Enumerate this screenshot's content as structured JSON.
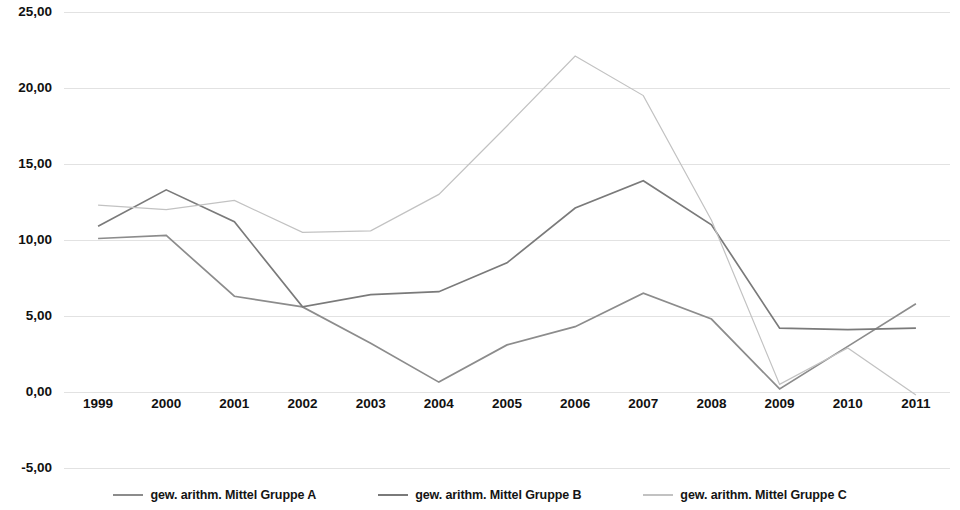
{
  "chart_data": {
    "type": "line",
    "title": "",
    "xlabel": "",
    "ylabel": "",
    "categories": [
      "1999",
      "2000",
      "2001",
      "2002",
      "2003",
      "2004",
      "2005",
      "2006",
      "2007",
      "2008",
      "2009",
      "2010",
      "2011"
    ],
    "ylim": [
      -5.0,
      25.0
    ],
    "yticks": [
      25.0,
      20.0,
      15.0,
      10.0,
      5.0,
      0.0,
      -5.0
    ],
    "ytick_labels": [
      "25,00",
      "20,00",
      "15,00",
      "10,00",
      "5,00",
      "0,00",
      "-5,00"
    ],
    "grid": true,
    "grid_axis": "y",
    "legend_position": "bottom",
    "decimal_separator": ",",
    "series": [
      {
        "name": "gew. arithm. Mittel Gruppe A",
        "color": "#8c8c8c",
        "values": [
          10.1,
          10.3,
          6.3,
          5.6,
          3.2,
          0.65,
          3.1,
          4.3,
          6.5,
          4.8,
          0.2,
          3.0,
          5.8
        ]
      },
      {
        "name": "gew. arithm. Mittel Gruppe B",
        "color": "#7a7a7a",
        "values": [
          10.9,
          13.3,
          11.2,
          5.6,
          6.4,
          6.6,
          8.5,
          12.1,
          13.9,
          11.0,
          4.2,
          4.1,
          4.2
        ]
      },
      {
        "name": "gew. arithm. Mittel Gruppe C",
        "color": "#c2c2c2",
        "values": [
          12.3,
          12.0,
          12.6,
          10.5,
          10.6,
          13.0,
          17.5,
          22.1,
          19.5,
          11.3,
          0.5,
          2.9,
          -0.2
        ]
      }
    ]
  },
  "legend": {
    "items": [
      {
        "label": "gew. arithm. Mittel Gruppe A",
        "color": "#8c8c8c"
      },
      {
        "label": "gew. arithm. Mittel Gruppe B",
        "color": "#7a7a7a"
      },
      {
        "label": "gew. arithm. Mittel Gruppe C",
        "color": "#c2c2c2"
      }
    ]
  },
  "colors": {
    "background": "#ffffff",
    "grid": "#e2e2e2",
    "text": "#111111",
    "series_a": "#8c8c8c",
    "series_b": "#7a7a7a",
    "series_c": "#c2c2c2"
  }
}
